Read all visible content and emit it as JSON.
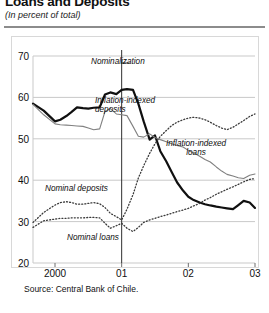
{
  "header": {
    "title": "Loans and Deposits",
    "subtitle": "(In percent of total)"
  },
  "source": "Source: Central Bank of Chile.",
  "annotations": {
    "nominalization": "Nominalization",
    "inflation_indexed_deposits": "Inflation-indexed\ndeposits",
    "inflation_indexed_loans": "Inflation-indexed\nloans",
    "nominal_deposits": "Nominal deposits",
    "nominal_loans": "Nominal loans"
  },
  "colors": {
    "bold_line": "#101010",
    "thin_line": "#808080",
    "dotted_line": "#3a3a3a",
    "gridline": "#c9c9c9",
    "frame": "#d8d8d8",
    "rule": "#8c8c8c"
  },
  "chart_data": {
    "type": "line",
    "title": "Loans and Deposits",
    "subtitle": "(In percent of total)",
    "xlabel": "",
    "ylabel": "",
    "ylim": [
      20,
      70
    ],
    "yticks": [
      20,
      30,
      40,
      50,
      60,
      70
    ],
    "xlim": [
      1999.67,
      2003.0
    ],
    "xticks": [
      2000,
      2001,
      2002,
      2003
    ],
    "xticklabels": [
      "2000",
      "01",
      "02",
      "03"
    ],
    "grid": true,
    "legend_position": "inline-annotations",
    "vertical_marker": {
      "x": 2001.0,
      "label": "Nominalization"
    },
    "series": [
      {
        "name": "Inflation-indexed deposits",
        "style": "solid-bold",
        "color": "#101010",
        "x": [
          1999.67,
          1999.83,
          2000.0,
          2000.08,
          2000.17,
          2000.25,
          2000.33,
          2000.42,
          2000.5,
          2000.58,
          2000.67,
          2000.75,
          2000.83,
          2000.92,
          2001.0,
          2001.08,
          2001.17,
          2001.25,
          2001.33,
          2001.42,
          2001.5,
          2001.58,
          2001.67,
          2001.75,
          2001.83,
          2001.92,
          2002.0,
          2002.08,
          2002.17,
          2002.25,
          2002.33,
          2002.42,
          2002.5,
          2002.58,
          2002.67,
          2002.75,
          2002.83,
          2002.92,
          2003.0
        ],
        "values": [
          58.5,
          56.8,
          54.2,
          54.6,
          55.5,
          56.5,
          57.6,
          57.4,
          57.3,
          57.5,
          57.6,
          60.7,
          61.2,
          60.8,
          61.8,
          62.0,
          61.8,
          58.5,
          54.2,
          49.8,
          50.8,
          47.0,
          44.5,
          42.0,
          39.5,
          37.5,
          36.0,
          35.2,
          34.6,
          34.2,
          33.9,
          33.6,
          33.4,
          33.2,
          33.0,
          34.0,
          35.0,
          34.6,
          33.3
        ]
      },
      {
        "name": "Inflation-indexed loans",
        "style": "solid-thin",
        "color": "#808080",
        "x": [
          1999.67,
          1999.83,
          2000.0,
          2000.08,
          2000.17,
          2000.25,
          2000.33,
          2000.42,
          2000.5,
          2000.58,
          2000.67,
          2000.75,
          2000.83,
          2000.92,
          2001.0,
          2001.08,
          2001.17,
          2001.25,
          2001.33,
          2001.42,
          2001.5,
          2001.58,
          2001.67,
          2001.75,
          2001.83,
          2001.92,
          2002.0,
          2002.08,
          2002.17,
          2002.25,
          2002.33,
          2002.42,
          2002.5,
          2002.58,
          2002.67,
          2002.75,
          2002.83,
          2002.92,
          2003.0
        ],
        "values": [
          58.3,
          55.8,
          53.6,
          53.4,
          53.3,
          53.2,
          53.1,
          53.0,
          52.6,
          52.2,
          52.4,
          56.6,
          57.3,
          56.0,
          55.8,
          55.6,
          53.0,
          50.6,
          50.4,
          51.2,
          50.3,
          49.8,
          49.3,
          48.8,
          48.4,
          48.0,
          47.2,
          46.6,
          45.8,
          45.0,
          44.4,
          43.2,
          42.2,
          41.4,
          41.0,
          40.6,
          40.4,
          41.2,
          41.5
        ]
      },
      {
        "name": "Nominal deposits",
        "style": "dotted",
        "color": "#3a3a3a",
        "x": [
          1999.67,
          1999.83,
          2000.0,
          2000.08,
          2000.17,
          2000.25,
          2000.33,
          2000.42,
          2000.5,
          2000.58,
          2000.67,
          2000.75,
          2000.83,
          2000.92,
          2001.0,
          2001.08,
          2001.17,
          2001.25,
          2001.33,
          2001.42,
          2001.5,
          2001.58,
          2001.67,
          2001.75,
          2001.83,
          2001.92,
          2002.0,
          2002.08,
          2002.17,
          2002.25,
          2002.33,
          2002.42,
          2002.5,
          2002.58,
          2002.67,
          2002.75,
          2002.83,
          2002.92,
          2003.0
        ],
        "values": [
          29.8,
          32.2,
          34.0,
          34.6,
          34.8,
          34.6,
          34.2,
          34.2,
          34.4,
          34.6,
          34.3,
          33.4,
          32.0,
          31.2,
          30.4,
          33.0,
          36.5,
          40.5,
          43.5,
          46.5,
          48.8,
          50.6,
          52.0,
          53.2,
          54.0,
          54.6,
          55.0,
          55.2,
          55.0,
          54.6,
          54.0,
          53.2,
          52.6,
          52.2,
          52.8,
          53.6,
          54.4,
          55.4,
          56.0
        ]
      },
      {
        "name": "Nominal loans",
        "style": "dotted",
        "color": "#3a3a3a",
        "x": [
          1999.67,
          1999.83,
          2000.0,
          2000.08,
          2000.17,
          2000.25,
          2000.33,
          2000.42,
          2000.5,
          2000.58,
          2000.67,
          2000.75,
          2000.83,
          2000.92,
          2001.0,
          2001.08,
          2001.17,
          2001.25,
          2001.33,
          2001.42,
          2001.5,
          2001.58,
          2001.67,
          2001.75,
          2001.83,
          2001.92,
          2002.0,
          2002.08,
          2002.17,
          2002.25,
          2002.33,
          2002.42,
          2002.5,
          2002.58,
          2002.67,
          2002.75,
          2002.83,
          2002.92,
          2003.0
        ],
        "values": [
          28.6,
          30.2,
          30.6,
          30.8,
          30.8,
          30.9,
          30.9,
          30.9,
          31.0,
          31.0,
          30.9,
          29.6,
          28.4,
          29.0,
          29.6,
          28.4,
          27.6,
          28.6,
          29.8,
          30.4,
          30.8,
          31.2,
          31.6,
          32.0,
          32.4,
          32.8,
          33.2,
          33.8,
          34.4,
          35.2,
          35.8,
          36.6,
          37.2,
          37.8,
          38.4,
          39.0,
          39.6,
          40.2,
          40.4
        ]
      }
    ]
  }
}
